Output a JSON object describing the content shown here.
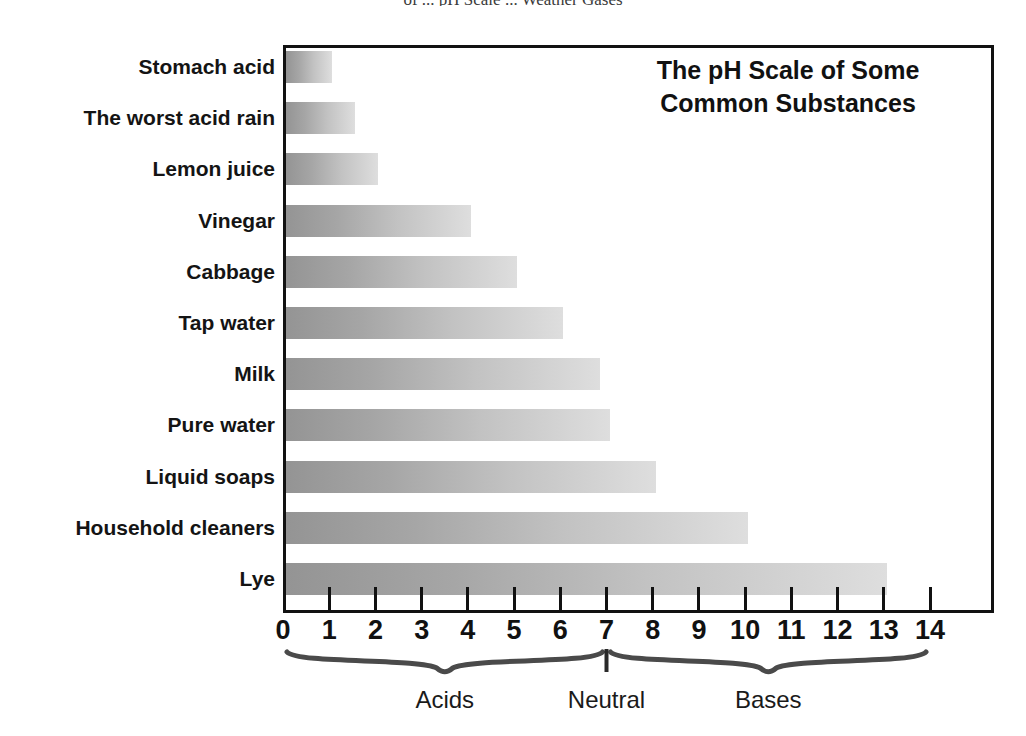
{
  "page": {
    "top_caption": "of ...  pH Scale  ...  Weather Gases"
  },
  "chart_data": {
    "type": "bar",
    "orientation": "horizontal",
    "title": "The pH Scale of Some Common Substances",
    "title_lines": [
      "The pH Scale of Some",
      "Common Substances"
    ],
    "xlabel": "",
    "ylabel": "",
    "xlim": [
      0,
      14
    ],
    "grid": false,
    "legend": null,
    "categories": [
      "Stomach acid",
      "The worst acid rain",
      "Lemon juice",
      "Vinegar",
      "Cabbage",
      "Tap water",
      "Milk",
      "Pure water",
      "Liquid soaps",
      "Household cleaners",
      "Lye"
    ],
    "values": [
      1,
      1.5,
      2,
      4,
      5,
      6,
      6.8,
      7,
      8,
      10,
      13
    ],
    "xticks": [
      0,
      1,
      2,
      3,
      4,
      5,
      6,
      7,
      8,
      9,
      10,
      11,
      12,
      13,
      14
    ],
    "xtick_labels": [
      "0",
      "1",
      "2",
      "3",
      "4",
      "5",
      "6",
      "7",
      "8",
      "9",
      "10",
      "11",
      "12",
      "13",
      "14"
    ],
    "annotations": [
      {
        "label": "Acids",
        "start": 0,
        "end": 7,
        "center": 3.5,
        "kind": "brace"
      },
      {
        "label": "Neutral",
        "start": 7,
        "end": 7,
        "center": 7.0,
        "kind": "marker"
      },
      {
        "label": "Bases",
        "start": 7,
        "end": 14,
        "center": 10.5,
        "kind": "brace"
      }
    ],
    "bar_gradient": {
      "from": "#949494",
      "to": "#dedede"
    },
    "frame_color": "#111111",
    "background": "#ffffff"
  }
}
